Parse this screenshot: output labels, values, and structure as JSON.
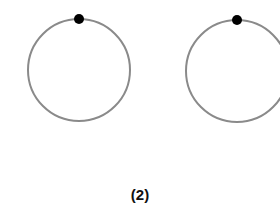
{
  "figure": {
    "label": "(2)",
    "circles": [
      {
        "cx": 79,
        "cy": 70,
        "r": 51,
        "dot_x": 79,
        "dot_y": 19
      },
      {
        "cx": 237,
        "cy": 71,
        "r": 51,
        "dot_x": 237,
        "dot_y": 20
      }
    ],
    "colors": {
      "circle_stroke": "#8a8a8a",
      "dot": "#000000"
    }
  }
}
